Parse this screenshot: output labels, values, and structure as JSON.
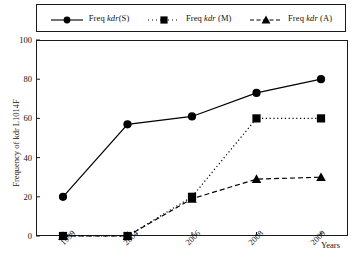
{
  "chart_data": {
    "type": "line",
    "title": "",
    "xlabel": "Years",
    "ylabel": "Frequency of kdr L1014F",
    "categories": [
      "1999",
      "2004",
      "2006",
      "2008",
      "2009"
    ],
    "ylim": [
      0,
      100
    ],
    "yticks": [
      0,
      20,
      40,
      60,
      80,
      100
    ],
    "grid": false,
    "legend_position": "top",
    "series": [
      {
        "name": "Freq kdr(S)",
        "name_prefix": "Freq ",
        "name_italic": "kdr",
        "name_suffix": "(S)",
        "marker": "circle",
        "line_style": "solid",
        "color": "#000000",
        "values": [
          20,
          57,
          61,
          73,
          80
        ]
      },
      {
        "name": "Freq kdr (M)",
        "name_prefix": "Freq ",
        "name_italic": "kdr",
        "name_suffix": " (M)",
        "marker": "square",
        "line_style": "dotted",
        "color": "#000000",
        "values": [
          0,
          0,
          20,
          60,
          60
        ]
      },
      {
        "name": "Freq kdr (A)",
        "name_prefix": "Freq ",
        "name_italic": "kdr",
        "name_suffix": " (A)",
        "marker": "triangle",
        "line_style": "dashed",
        "color": "#000000",
        "values": [
          0,
          0,
          19,
          29,
          30
        ]
      }
    ]
  },
  "axis": {
    "y_title": "Frequency of kdr L1014F",
    "x_title": "Years",
    "y_tick_labels": [
      "0",
      "20",
      "40",
      "60",
      "80",
      "100"
    ],
    "x_tick_labels": [
      "1999",
      "2004",
      "2006",
      "2008",
      "2009"
    ]
  },
  "legend": {
    "entries": [
      {
        "prefix": "Freq ",
        "italic": "kdr",
        "suffix": "(S)"
      },
      {
        "prefix": "Freq ",
        "italic": "kdr",
        "suffix": " (M)"
      },
      {
        "prefix": "Freq ",
        "italic": "kdr",
        "suffix": " (A)"
      }
    ]
  },
  "colors": {
    "ink": "#1a1a1a",
    "background": "#ffffff"
  }
}
